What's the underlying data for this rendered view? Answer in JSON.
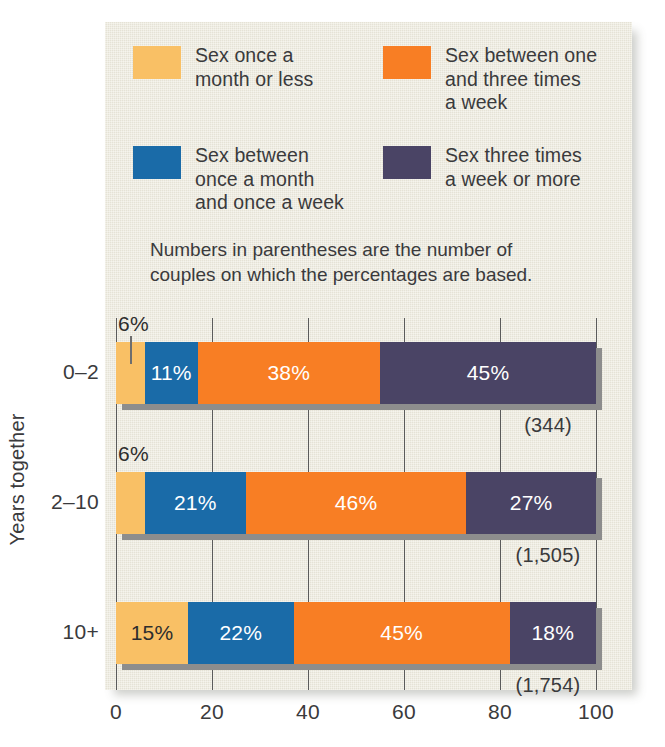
{
  "legend": {
    "items": [
      {
        "label": "Sex once a\nmonth or less",
        "color": "#F9C065",
        "key": "once_month_or_less"
      },
      {
        "label": "Sex between one\nand three times\na week",
        "color": "#F87E24",
        "key": "one_to_three_week"
      },
      {
        "label": "Sex between\nonce a month\nand once a week",
        "color": "#1A6BA8",
        "key": "month_to_week"
      },
      {
        "label": "Sex three times\na week or more",
        "color": "#4A4465",
        "key": "three_plus_week"
      }
    ]
  },
  "note": "Numbers in parentheses are the number of\ncouples on which the percentages are based.",
  "axis": {
    "y_title": "Years together",
    "x_ticks": [
      "0",
      "20",
      "40",
      "60",
      "80",
      "100"
    ]
  },
  "chart_data": {
    "type": "bar",
    "orientation": "horizontal",
    "stacked": true,
    "title": "",
    "xlabel": "",
    "ylabel": "Years together",
    "xlim": [
      0,
      100
    ],
    "grid": true,
    "legend_position": "top",
    "categories": [
      "0–2",
      "2–10",
      "10+"
    ],
    "series": [
      {
        "name": "Sex once a month or less",
        "color": "#F9C065",
        "values": [
          6,
          6,
          15
        ]
      },
      {
        "name": "Sex between once a month and once a week",
        "color": "#1A6BA8",
        "values": [
          11,
          21,
          22
        ]
      },
      {
        "name": "Sex between one and three times a week",
        "color": "#F87E24",
        "values": [
          38,
          46,
          45
        ]
      },
      {
        "name": "Sex three times a week or more",
        "color": "#4A4465",
        "values": [
          45,
          27,
          18
        ]
      }
    ],
    "value_labels": [
      [
        "6%",
        "11%",
        "38%",
        "45%"
      ],
      [
        "6%",
        "21%",
        "46%",
        "27%"
      ],
      [
        "15%",
        "22%",
        "45%",
        "18%"
      ]
    ],
    "counts": [
      "(344)",
      "(1,505)",
      "(1,754)"
    ],
    "annotations": [
      {
        "text": "6%",
        "row": 0,
        "kind": "external-label-with-leader"
      },
      {
        "text": "6%",
        "row": 1,
        "kind": "external-label"
      }
    ]
  }
}
